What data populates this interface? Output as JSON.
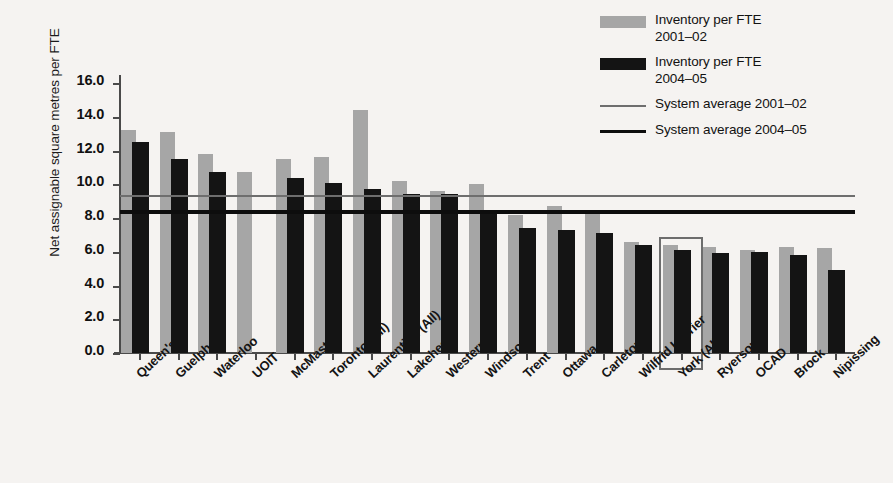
{
  "chart_data": {
    "type": "bar",
    "title": "",
    "xlabel": "",
    "ylabel": "Net assignable square metres per FTE",
    "ylim": [
      0.0,
      16.0
    ],
    "ytick_step": 2.0,
    "yticks": [
      "16.0",
      "14.0",
      "12.0",
      "10.0",
      "8.0",
      "6.0",
      "4.0",
      "2.0",
      "0.0"
    ],
    "grid": false,
    "legend_position": "top-right",
    "categories": [
      "Queen's",
      "Guelph",
      "Waterloo",
      "UOIT",
      "McMaster",
      "Toronto (All)",
      "Laurentian (All)",
      "Lakehead",
      "Western",
      "Windsor",
      "Trent",
      "Ottawa",
      "Carleton",
      "Wilfrid Laurier",
      "York (All)",
      "Ryerson",
      "OCAD",
      "Brock",
      "Nipissing"
    ],
    "series": [
      {
        "name": "Inventory per FTE 2001–02",
        "color": "#a6a6a6",
        "values": [
          13.2,
          13.1,
          11.8,
          10.7,
          11.5,
          11.6,
          14.4,
          10.2,
          9.6,
          10.0,
          8.2,
          8.7,
          8.4,
          6.6,
          6.4,
          6.3,
          6.1,
          6.3,
          6.2
        ]
      },
      {
        "name": "Inventory per FTE 2004–05",
        "color": "#141414",
        "values": [
          12.5,
          11.5,
          10.7,
          null,
          10.4,
          10.1,
          9.7,
          9.4,
          9.4,
          8.4,
          7.4,
          7.3,
          7.1,
          6.4,
          6.1,
          5.9,
          6.0,
          5.8,
          4.9
        ]
      }
    ],
    "reference_lines": [
      {
        "name": "System average 2001–02",
        "value": 9.35,
        "color": "#6e6e6e",
        "style": "thin"
      },
      {
        "name": "System average 2004–05",
        "value": 8.45,
        "color": "#0d0d0d",
        "style": "thick"
      }
    ],
    "annotations": [
      {
        "type": "highlight-box",
        "target_category": "York (All)",
        "color": "#6d6d6d"
      }
    ]
  },
  "legend": {
    "entries": [
      {
        "swatch": "gray-square",
        "line1": "Inventory per FTE",
        "line2": "2001–02"
      },
      {
        "swatch": "black-square",
        "line1": "Inventory per FTE",
        "line2": "2004–05"
      },
      {
        "swatch": "thin-line",
        "line1": "System average 2001–02",
        "line2": ""
      },
      {
        "swatch": "thick-line",
        "line1": "System average 2004–05",
        "line2": ""
      }
    ]
  }
}
